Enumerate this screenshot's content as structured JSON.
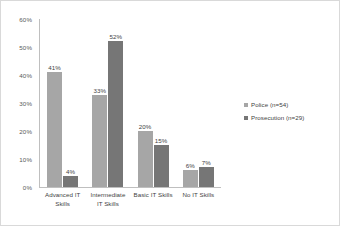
{
  "chart_data": {
    "type": "bar",
    "title": "",
    "subtitle": "",
    "xlabel": "",
    "ylabel": "",
    "ylim": [
      0,
      60
    ],
    "ytick_labels": [
      "60%",
      "50%",
      "40%",
      "30%",
      "20%",
      "10%",
      "0%"
    ],
    "yticks": [
      60,
      50,
      40,
      30,
      20,
      10,
      0
    ],
    "grid": false,
    "legend_position": "right",
    "value_suffix": "%",
    "categories": [
      "Advanced IT Skills",
      "Intermediate IT Skills",
      "Basic IT Skills",
      "No IT Skills"
    ],
    "category_lines": [
      [
        "Advanced IT",
        "Skills"
      ],
      [
        "Intermediate",
        "IT Skills"
      ],
      [
        "Basic IT Skills"
      ],
      [
        "No IT Skills"
      ]
    ],
    "series": [
      {
        "name": "Police (n=54)",
        "color": "#a6a6a6",
        "values": [
          41,
          33,
          20,
          6
        ],
        "labels": [
          "41%",
          "33%",
          "20%",
          "6%"
        ]
      },
      {
        "name": "Prosecution (n=29)",
        "color": "#767676",
        "values": [
          4,
          52,
          15,
          7
        ],
        "labels": [
          "4%",
          "52%",
          "15%",
          "7%"
        ]
      }
    ]
  },
  "legend": {
    "items": [
      {
        "label": "Police (n=54)",
        "color": "#a6a6a6"
      },
      {
        "label": "Prosecution (n=29)",
        "color": "#767676"
      }
    ]
  }
}
